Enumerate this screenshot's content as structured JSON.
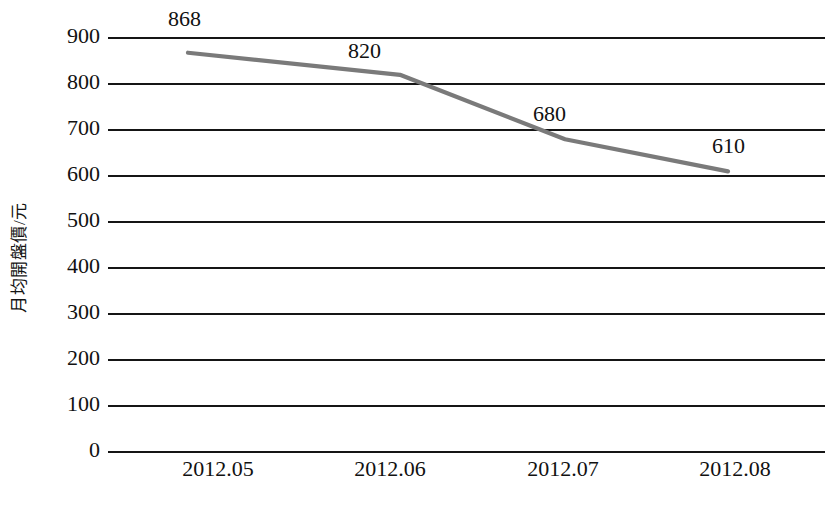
{
  "chart_data": {
    "type": "line",
    "title": "",
    "xlabel": "",
    "ylabel": "月均開盤價/元",
    "categories": [
      "2012.05",
      "2012.06",
      "2012.07",
      "2012.08"
    ],
    "values": [
      868,
      820,
      680,
      610
    ],
    "point_labels": [
      "868",
      "820",
      "680",
      "610"
    ],
    "series": [
      {
        "name": "月均開盤價",
        "values": [
          868,
          820,
          680,
          610
        ],
        "color": "#7a7a7a"
      }
    ],
    "ylim": [
      0,
      900
    ],
    "ytick_values": [
      900,
      800,
      700,
      600,
      500,
      400,
      300,
      200,
      100,
      0
    ],
    "ytick_labels": [
      "900",
      "800",
      "700",
      "600",
      "500",
      "400",
      "300",
      "200",
      "100",
      "0"
    ],
    "xtick_labels": [
      "2012.05",
      "2012.06",
      "2012.07",
      "2012.08"
    ],
    "grid": true,
    "grid_axis": "y",
    "legend": false,
    "legend_position": "none",
    "line_color": "#7a7a7a",
    "grid_color": "#151515",
    "background_color": "#ffffff",
    "markers": false
  }
}
